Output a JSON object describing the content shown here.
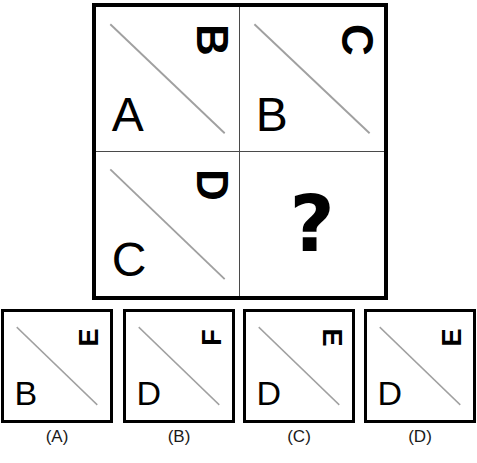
{
  "puzzle": {
    "type": "letter-sequence-matrix",
    "colors": {
      "frame": "#000000",
      "divider": "#4a4a4a",
      "diagonal": "#a0a0a0",
      "glyph": "#000000",
      "background": "#ffffff"
    },
    "matrix": {
      "rows": 2,
      "cols": 2,
      "cells": [
        {
          "position": "top-left",
          "upright_letter": "A",
          "rotated_letter": "B",
          "rotation_deg": 90,
          "rotation_dir": "clockwise",
          "diagonal": "top-left-to-bottom-right",
          "is_question": false
        },
        {
          "position": "top-right",
          "upright_letter": "B",
          "rotated_letter": "C",
          "rotation_deg": 90,
          "rotation_dir": "clockwise",
          "diagonal": "top-left-to-bottom-right",
          "is_question": false
        },
        {
          "position": "bottom-left",
          "upright_letter": "C",
          "rotated_letter": "D",
          "rotation_deg": 90,
          "rotation_dir": "clockwise",
          "diagonal": "top-left-to-bottom-right",
          "is_question": false
        },
        {
          "position": "bottom-right",
          "upright_letter": "",
          "rotated_letter": "",
          "rotation_deg": 0,
          "rotation_dir": "",
          "diagonal": "none",
          "is_question": true,
          "question_glyph": "?"
        }
      ]
    },
    "options": [
      {
        "label": "(A)",
        "key": "A",
        "upright_letter": "B",
        "rotated_letter": "E",
        "rotation_deg": 90,
        "rotation_dir": "counter-clockwise",
        "diagonal": "top-left-to-bottom-right"
      },
      {
        "label": "(B)",
        "key": "B",
        "upright_letter": "D",
        "rotated_letter": "F",
        "rotation_deg": 90,
        "rotation_dir": "counter-clockwise",
        "diagonal": "top-left-to-bottom-right"
      },
      {
        "label": "(C)",
        "key": "C",
        "upright_letter": "D",
        "rotated_letter": "E",
        "rotation_deg": 90,
        "rotation_dir": "clockwise",
        "diagonal": "top-left-to-bottom-right"
      },
      {
        "label": "(D)",
        "key": "D",
        "upright_letter": "D",
        "rotated_letter": "E",
        "rotation_deg": 90,
        "rotation_dir": "counter-clockwise",
        "diagonal": "top-left-to-bottom-right"
      }
    ]
  }
}
